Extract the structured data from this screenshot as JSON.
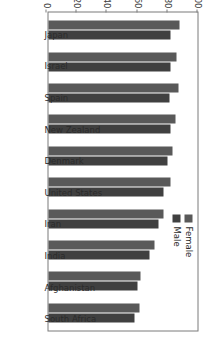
{
  "chart_data": {
    "type": "bar",
    "title": "",
    "subtitle": "",
    "xlabel": "",
    "ylabel": "",
    "ylim": [
      0,
      100
    ],
    "yticks": [
      0,
      20,
      40,
      60,
      80,
      100
    ],
    "grid": false,
    "orientation": "vertical-rotated-90",
    "legend_position": "top-right",
    "categories": [
      "Japan",
      "Israel",
      "Spain",
      "New Zealand",
      "Denmark",
      "United States",
      "Iran",
      "India",
      "Afghanistan",
      "South Africa"
    ],
    "series": [
      {
        "name": "Female",
        "color": "#595959",
        "values": [
          87,
          85,
          86,
          84,
          82,
          81,
          76,
          70,
          61,
          60
        ]
      },
      {
        "name": "Male",
        "color": "#404040",
        "values": [
          81,
          81,
          80,
          81,
          79,
          76,
          73,
          67,
          59,
          57
        ]
      }
    ]
  },
  "legend": {
    "items": [
      {
        "label": "Female",
        "color": "#595959"
      },
      {
        "label": "Male",
        "color": "#404040"
      }
    ]
  },
  "axis": {
    "tick_labels": [
      "0",
      "20",
      "40",
      "60",
      "80",
      "100"
    ]
  }
}
